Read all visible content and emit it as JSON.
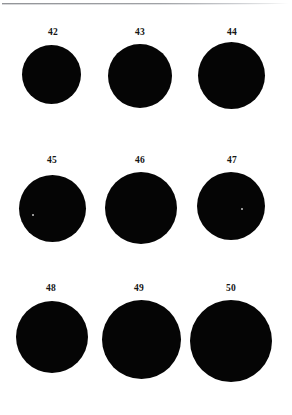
{
  "page": {
    "background_color": "#ffffff",
    "ink_color": "#050505",
    "rule_color": "#8d8f93",
    "width": 292,
    "height": 415
  },
  "header": {
    "rule_name": "top-page-rule"
  },
  "figure": {
    "caption": "",
    "columns": 3,
    "rows": 3,
    "specimens": [
      {
        "label": "42",
        "label_x": 41,
        "label_y": 27,
        "label_w": 24,
        "disc_x": 22,
        "disc_y": 45,
        "disc_size": 59,
        "speck": null
      },
      {
        "label": "43",
        "label_x": 128,
        "label_y": 27,
        "label_w": 24,
        "disc_x": 108,
        "disc_y": 44,
        "disc_size": 64,
        "speck": null
      },
      {
        "label": "44",
        "label_x": 220,
        "label_y": 27,
        "label_w": 24,
        "disc_x": 198,
        "disc_y": 42,
        "disc_size": 67,
        "speck": null
      },
      {
        "label": "45",
        "label_x": 40,
        "label_y": 155,
        "label_w": 24,
        "disc_x": 19,
        "disc_y": 175,
        "disc_size": 67,
        "speck": {
          "x": 13,
          "y": 39,
          "size": 2
        }
      },
      {
        "label": "46",
        "label_x": 128,
        "label_y": 155,
        "label_w": 24,
        "disc_x": 105,
        "disc_y": 172,
        "disc_size": 72,
        "speck": null
      },
      {
        "label": "47",
        "label_x": 220,
        "label_y": 155,
        "label_w": 24,
        "disc_x": 197,
        "disc_y": 172,
        "disc_size": 68,
        "speck": {
          "x": 44,
          "y": 36,
          "size": 2
        }
      },
      {
        "label": "48",
        "label_x": 39,
        "label_y": 283,
        "label_w": 24,
        "disc_x": 16,
        "disc_y": 301,
        "disc_size": 72,
        "speck": null
      },
      {
        "label": "49",
        "label_x": 127,
        "label_y": 283,
        "label_w": 24,
        "disc_x": 102,
        "disc_y": 300,
        "disc_size": 79,
        "speck": null
      },
      {
        "label": "50",
        "label_x": 219,
        "label_y": 283,
        "label_w": 24,
        "disc_x": 190,
        "disc_y": 300,
        "disc_size": 82,
        "speck": null
      }
    ]
  }
}
